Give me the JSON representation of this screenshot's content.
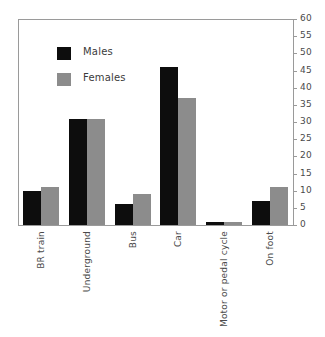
{
  "chart_data": {
    "type": "bar",
    "title": "",
    "subtitle": "",
    "xlabel": "",
    "ylabel": "",
    "categories": [
      "BR train",
      "Underground",
      "Bus",
      "Car",
      "Motor or pedal cycle",
      "On foot"
    ],
    "series": [
      {
        "name": "Males",
        "color": "#0d0d0d",
        "values": [
          10,
          31,
          6,
          46,
          1,
          7
        ]
      },
      {
        "name": "Females",
        "color": "#8c8c8c",
        "values": [
          11,
          31,
          9,
          37,
          1,
          11
        ]
      }
    ],
    "ylim": [
      0,
      60
    ],
    "ytick_step": 5,
    "yticks": [
      0,
      5,
      10,
      15,
      20,
      25,
      30,
      35,
      40,
      45,
      50,
      55,
      60
    ],
    "ytick_labels": [
      "0",
      "5",
      "10",
      "15",
      "20",
      "25",
      "30",
      "35",
      "40",
      "45",
      "50",
      "55",
      "60"
    ],
    "y_axis_position": "right",
    "grid": false,
    "legend_position": "inside-top-left",
    "category_label_rotation": -90,
    "bar_orientation": "vertical",
    "grouping": "grouped"
  },
  "legend": {
    "entries": [
      {
        "label": "Males",
        "color": "#0d0d0d"
      },
      {
        "label": "Females",
        "color": "#8c8c8c"
      }
    ]
  },
  "axis": {
    "line_color": "#9a9a9a",
    "tick_color": "#9a9a9a",
    "label_color": "#4a4a4a"
  },
  "figure": {
    "background": "#ffffff"
  }
}
